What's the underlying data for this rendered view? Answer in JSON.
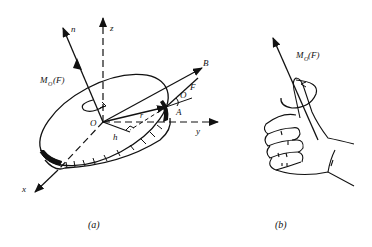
{
  "figure_a": {
    "caption": "(a)",
    "labels": {
      "n": "n",
      "z": "z",
      "moment": "M",
      "moment_sub": "O",
      "moment_arg": "(F)",
      "B": "B",
      "F": "F",
      "O_angle": "O",
      "A": "A",
      "O": "O",
      "r": "r",
      "h": "h",
      "y": "y",
      "x": "x"
    }
  },
  "figure_b": {
    "caption": "(b)",
    "labels": {
      "moment": "M",
      "moment_sub": "O",
      "moment_arg": "(F)"
    }
  },
  "colors": {
    "ink": "#111111",
    "background": "#ffffff"
  }
}
